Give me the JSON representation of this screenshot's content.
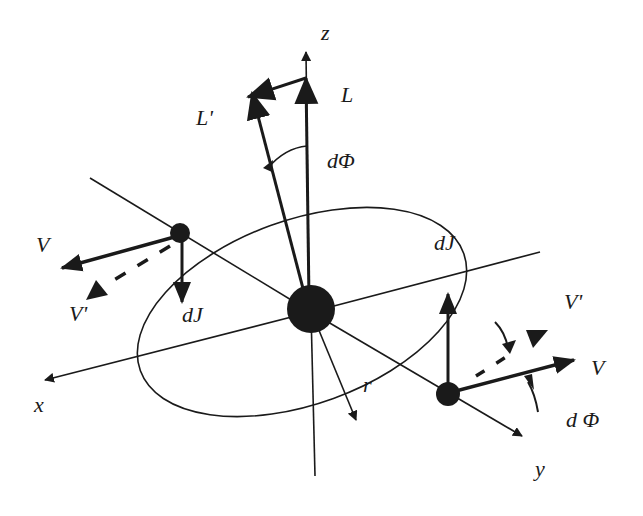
{
  "diagram": {
    "colors": {
      "ink": "#1a1a1a",
      "background": "#ffffff"
    },
    "labels": {
      "z_axis": "z",
      "x_axis": "x",
      "y_axis": "y",
      "L": "L",
      "L_prime": "L'",
      "d_phi_top": "dΦ",
      "V_left": "V",
      "V_prime_left": "V'",
      "dJ_left": "dJ",
      "dJ_right": "dJ",
      "V_prime_right": "V'",
      "V_right": "V",
      "d_phi_right": "d Φ",
      "r": "r"
    },
    "elements": [
      "z-axis",
      "x-axis",
      "y-axis",
      "orbit-ellipse",
      "central-mass",
      "left-mass",
      "right-mass",
      "L-vector",
      "L-prime-vector",
      "dL-vector",
      "V-vectors",
      "V-prime-dashed-vectors",
      "dJ-vectors",
      "radius-r"
    ]
  }
}
